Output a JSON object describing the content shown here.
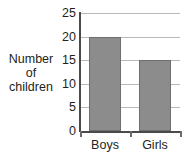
{
  "chart_data": {
    "type": "bar",
    "title": "",
    "xlabel": "",
    "ylabel": "Number of children",
    "ylabel_lines": [
      "Number",
      "of",
      "children"
    ],
    "categories": [
      "Boys",
      "Girls"
    ],
    "values": [
      20,
      15
    ],
    "ylim": [
      0,
      25
    ],
    "yticks": [
      0,
      5,
      10,
      15,
      20,
      25
    ],
    "ytick_labels": [
      "0",
      "5",
      "10",
      "15",
      "20",
      "25"
    ],
    "grid": true,
    "grid_axis": "y",
    "legend": false,
    "bar_color": "#8c8c8c",
    "bar_border_color": "#6e6e6e",
    "grid_color": "#b9b9b9",
    "axis_color": "#4a4a4a",
    "text_color": "#231f20",
    "background": "#ffffff"
  }
}
